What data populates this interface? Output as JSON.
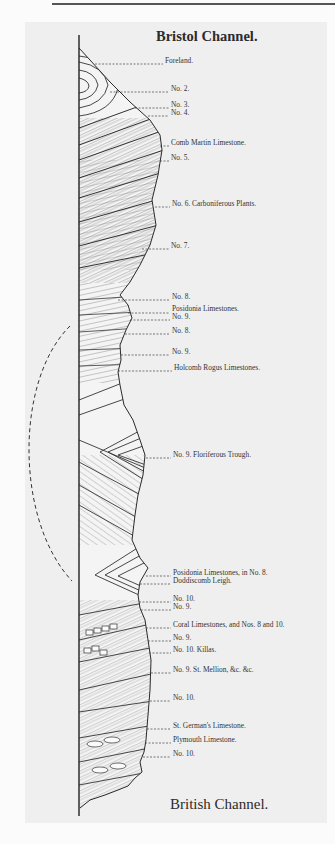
{
  "diagram": {
    "title_top": "Bristol Channel.",
    "title_bottom": "British Channel.",
    "labels": [
      {
        "text": "Foreland.",
        "x": 165,
        "y": 61
      },
      {
        "text": "No. 2.",
        "x": 171,
        "y": 89
      },
      {
        "text": "No. 3.",
        "x": 171,
        "y": 105
      },
      {
        "text": "No. 4.",
        "x": 171,
        "y": 113
      },
      {
        "text": "Comb Martin Limestone.",
        "x": 171,
        "y": 143
      },
      {
        "text": "No. 5.",
        "x": 171,
        "y": 158
      },
      {
        "text": "No. 6. Carboniferous Plants.",
        "x": 172,
        "y": 204
      },
      {
        "text": "No. 7.",
        "x": 171,
        "y": 246
      },
      {
        "text": "No. 8.",
        "x": 172,
        "y": 297
      },
      {
        "text": "Posidonia Limestones.",
        "x": 172,
        "y": 309
      },
      {
        "text": "No. 9.",
        "x": 172,
        "y": 317
      },
      {
        "text": "No. 8.",
        "x": 172,
        "y": 331
      },
      {
        "text": "No. 9.",
        "x": 172,
        "y": 352
      },
      {
        "text": "Holcomb Rogus Limestones.",
        "x": 174,
        "y": 368
      },
      {
        "text": "No. 9. Floriferous Trough.",
        "x": 173,
        "y": 455
      },
      {
        "text": "Posidonia Limestones, in No. 8.",
        "x": 173,
        "y": 573
      },
      {
        "text": "Doddiscomb Leigh.",
        "x": 173,
        "y": 581
      },
      {
        "text": "No. 10.",
        "x": 173,
        "y": 599
      },
      {
        "text": "No. 9.",
        "x": 173,
        "y": 607
      },
      {
        "text": "Coral Limestones, and Nos. 8 and 10.",
        "x": 173,
        "y": 625
      },
      {
        "text": "No. 9.",
        "x": 173,
        "y": 638
      },
      {
        "text": "No. 10. Killas.",
        "x": 173,
        "y": 650
      },
      {
        "text": "No. 9. St. Mellion, &c. &c.",
        "x": 173,
        "y": 670
      },
      {
        "text": "No. 10.",
        "x": 173,
        "y": 698
      },
      {
        "text": "St. German's Limestone.",
        "x": 173,
        "y": 726
      },
      {
        "text": "Plymouth Limestone.",
        "x": 173,
        "y": 740
      },
      {
        "text": "No. 10.",
        "x": 173,
        "y": 754
      }
    ]
  }
}
